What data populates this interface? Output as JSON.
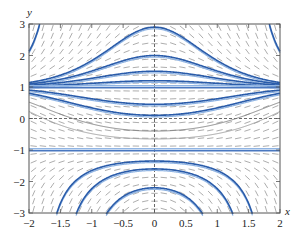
{
  "chart_data": {
    "type": "line",
    "title": "",
    "subtitle": "Direction (slope) field with solution curves",
    "xlabel": "x",
    "ylabel": "y",
    "xlim": [
      -2,
      2
    ],
    "ylim": [
      -3,
      3
    ],
    "x_ticks": [
      "-2",
      "-1.5",
      "-1",
      "-0.5",
      "0",
      "0.5",
      "1",
      "1.5",
      "2"
    ],
    "x_tick_values": [
      -2,
      -1.5,
      -1,
      -0.5,
      0,
      0.5,
      1,
      1.5,
      2
    ],
    "y_ticks": [
      "-3",
      "-2",
      "-1",
      "0",
      "1",
      "2",
      "3"
    ],
    "y_tick_values": [
      -3,
      -2,
      -1,
      0,
      1,
      2,
      3
    ],
    "grid": false,
    "dashed_axes": {
      "x0": true,
      "y0": true
    },
    "legend": null,
    "slope_field": {
      "nx": 27,
      "ny": 24,
      "color": "#8a8a8a",
      "relation": "dy/dx proportional to -x(y^2-1)"
    },
    "equilibria": [
      {
        "name": "y = 1",
        "y": 1
      },
      {
        "name": "y = -1",
        "y": -1
      }
    ],
    "series": [
      {
        "name": "curve above 1 (peak 2.9)",
        "y_at_x0": 2.9,
        "color": "#2a5caa"
      },
      {
        "name": "curve above 1 (peak 2.0)",
        "y_at_x0": 2.0,
        "color": "#2a5caa"
      },
      {
        "name": "curve above 1 (peak 1.5)",
        "y_at_x0": 1.5,
        "color": "#2a5caa"
      },
      {
        "name": "curve above 1 (peak 1.2)",
        "y_at_x0": 1.2,
        "color": "#2a5caa"
      },
      {
        "name": "curve between (min 0.45)",
        "y_at_x0": 0.45,
        "color": "#2a5caa"
      },
      {
        "name": "curve between (min 0.1)",
        "y_at_x0": 0.1,
        "color": "#2a5caa"
      },
      {
        "name": "curve between (min -0.4)",
        "y_at_x0": -0.4,
        "color": "#7a7a7a"
      },
      {
        "name": "curve between (min -0.65)",
        "y_at_x0": -0.65,
        "color": "#9a9a9a"
      },
      {
        "name": "arch below -1 (peak -1.35)",
        "y_at_x0": -1.35,
        "color": "#2a5caa"
      },
      {
        "name": "arch below -1 (peak -1.6)",
        "y_at_x0": -1.6,
        "color": "#2a5caa"
      },
      {
        "name": "arch below -1 (peak -2.2)",
        "y_at_x0": -2.2,
        "color": "#2a5caa"
      }
    ],
    "colors": {
      "curve": "#2a5caa",
      "curve_light": "#8fb4e3",
      "equilibrium": "#4a78c0",
      "field": "#8a8a8a",
      "frame": "#555555"
    }
  }
}
